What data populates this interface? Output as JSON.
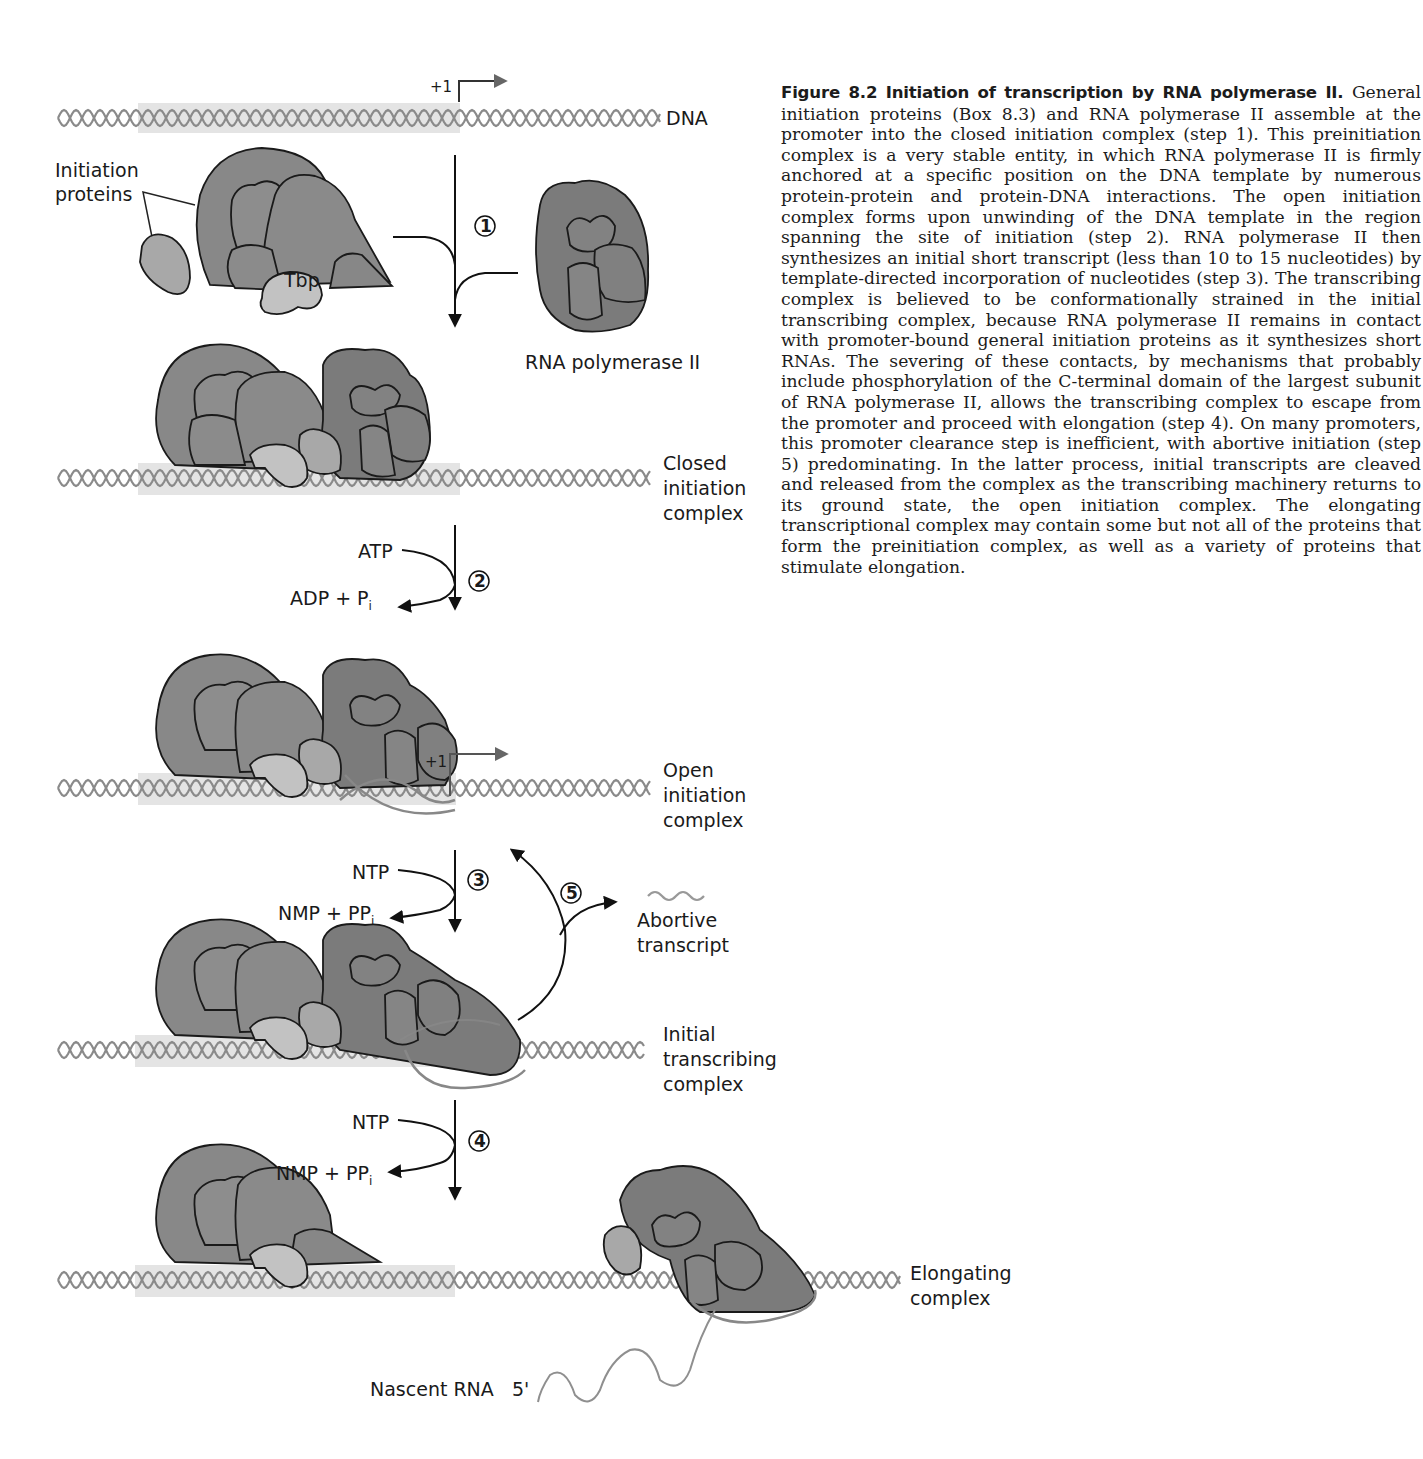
{
  "figure": {
    "number_label": "Figure 8.2",
    "title": "Initiation of transcription by RNA polymerase II.",
    "caption_body": "General initiation proteins (Box 8.3) and RNA polymerase II assemble at the promoter into the closed initiation complex (step 1). This preinitiation complex is a very stable entity, in which RNA polymerase II is firmly anchored at a specific position on the DNA template by numerous protein-protein and protein-DNA interactions. The open initiation complex forms upon unwinding of the DNA template in the region spanning the site of initiation (step 2). RNA polymerase II then synthesizes an initial short transcript (less than 10 to 15 nucleotides) by template-directed incorporation of nucleotides (step 3). The transcribing complex is believed to be conformationally strained in the initial transcribing complex, because RNA polymerase II remains in contact with promoter-bound general initiation proteins as it synthesizes short RNAs. The severing of these contacts, by mechanisms that probably include phosphorylation of the C-terminal domain of the largest subunit of RNA polymerase II, allows the transcribing complex to escape from the promoter and proceed with elongation (step 4). On many promoters, this promoter clearance step is inefficient, with abortive initiation (step 5) predominating. In the latter process, initial transcripts are cleaved and released from the complex as the transcribing machinery returns to its ground state, the open initiation complex. The elongating transcriptional complex may contain some but not all of the proteins that form the preinitiation complex, as well as a variety of proteins that stimulate elongation."
  },
  "diagram": {
    "labels": {
      "dna": "DNA",
      "start_site": "+1",
      "initiation_proteins_1": "Initiation",
      "initiation_proteins_2": "proteins",
      "tbp": "Tbp",
      "rna_pol": "RNA polymerase II",
      "closed_1": "Closed",
      "closed_2": "initiation",
      "closed_3": "complex",
      "open_1": "Open",
      "open_2": "initiation",
      "open_3": "complex",
      "initial_1": "Initial",
      "initial_2": "transcribing",
      "initial_3": "complex",
      "abortive_1": "Abortive",
      "abortive_2": "transcript",
      "elongating_1": "Elongating",
      "elongating_2": "complex",
      "nascent_rna": "Nascent RNA",
      "five_prime": "5'"
    },
    "reactions": {
      "atp": "ATP",
      "adp": "ADP + P",
      "pi_sub": "i",
      "ntp": "NTP",
      "nmp": "NMP + PP",
      "ppi_sub": "i"
    },
    "steps": [
      "1",
      "2",
      "3",
      "4",
      "5"
    ],
    "colors": {
      "dna_strand": "#8a8a8a",
      "promoter_shade": "#e3e3e3",
      "protein_dark": "#7d7d7d",
      "protein_mid": "#8e8e8e",
      "protein_light": "#b3b3b3",
      "tbp": "#c4c4c4",
      "outline": "#1a1a1a",
      "rna": "#8f8f8f"
    }
  }
}
